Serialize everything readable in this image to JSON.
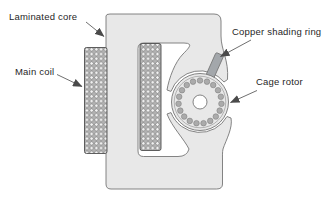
{
  "diagram": {
    "type": "shaded-pole motor cross-section",
    "labels": {
      "laminated_core": "Laminated core",
      "main_coil": "Main coil",
      "copper_shading_ring": "Copper shading ring",
      "cage_rotor": "Cage rotor"
    },
    "rotor": {
      "bar_count": 19,
      "bar_ring_radius": 21.5,
      "bar_radius": 2.8,
      "center_x": 200,
      "center_y": 102,
      "outer_radius": 28.5,
      "inner_ring_radius": 25.8,
      "shaft_hole_radius": 7
    },
    "colors": {
      "background": "#ffffff",
      "core_fill": "#e8e8e8",
      "outline": "#767676",
      "coil_mesh_stroke": "#4f4f4f",
      "coil_fill": "#f5f5f5",
      "shading_ring_fill": "#a3a7ab",
      "rotor_bar_fill": "#ababab",
      "arrow": "#4a4a4a",
      "label_text": "#1f1f1f"
    }
  }
}
